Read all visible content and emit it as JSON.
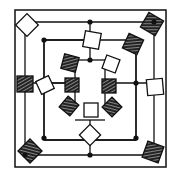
{
  "diagram": {
    "title": "",
    "colors": {
      "ink": "#111111",
      "background": "#ffffff",
      "node_white": "#ffffff"
    },
    "frame": {
      "x": 15,
      "y": 10,
      "w": 151,
      "h": 157
    },
    "rings": [
      {
        "name": "outer-ring",
        "path": "M25,22 L154,22 L154,155 L25,155 Z"
      },
      {
        "name": "middle-ring",
        "path": "M44,40 L136,40 L136,140 L44,140 Z"
      }
    ],
    "connector_lines": [
      "M90,22 L90,60",
      "M44,40 L90,40",
      "M44,40 L44,140",
      "M66,83 L44,83",
      "M66,83 L25,83",
      "M114,83 L154,83",
      "M90,120 L90,140",
      "M90,140 L90,155",
      "M44,140 L90,140",
      "M90,140 L136,140",
      "M136,40 L136,140",
      "M90,60 L75,60",
      "M90,60 L105,60",
      "M90,120 L75,120",
      "M90,120 L105,120",
      "M75,83 L75,105",
      "M105,83 L105,105",
      "M105,60 L105,83",
      "M75,60 L75,83"
    ],
    "dots": [
      {
        "x": 90,
        "y": 22
      },
      {
        "x": 44,
        "y": 40
      },
      {
        "x": 90,
        "y": 60
      },
      {
        "x": 136,
        "y": 83
      },
      {
        "x": 44,
        "y": 138
      },
      {
        "x": 90,
        "y": 155
      },
      {
        "x": 136,
        "y": 138
      },
      {
        "x": 25,
        "y": 155
      },
      {
        "x": 154,
        "y": 22
      }
    ],
    "nodes": [
      {
        "name": "node-top-left-corner",
        "style": "white",
        "cx": 27,
        "cy": 25,
        "size": 16,
        "rot": 45
      },
      {
        "name": "node-top-right-corner",
        "style": "hatch",
        "cx": 152,
        "cy": 24,
        "size": 17,
        "rot": 30
      },
      {
        "name": "node-bottom-left-corner",
        "style": "hatch",
        "cx": 30,
        "cy": 151,
        "size": 17,
        "rot": 45
      },
      {
        "name": "node-bottom-right-corner",
        "style": "hatch",
        "cx": 153,
        "cy": 152,
        "size": 17,
        "rot": 20
      },
      {
        "name": "node-left-mid",
        "style": "hatch",
        "cx": 25,
        "cy": 84,
        "size": 16,
        "rot": 0
      },
      {
        "name": "node-right-mid",
        "style": "white",
        "cx": 155,
        "cy": 87,
        "size": 16,
        "rot": -5
      },
      {
        "name": "node-top-mid",
        "style": "white",
        "cx": 92,
        "cy": 40,
        "size": 16,
        "rot": 10
      },
      {
        "name": "node-bottom-mid",
        "style": "white",
        "cx": 90,
        "cy": 135,
        "size": 15,
        "rot": 45
      },
      {
        "name": "node-ring-top-right-hatch",
        "style": "hatch",
        "cx": 133,
        "cy": 44,
        "size": 16,
        "rot": 25
      },
      {
        "name": "node-ring-left-white",
        "style": "white",
        "cx": 45,
        "cy": 85,
        "size": 14,
        "rot": -25
      },
      {
        "name": "node-inner-top-left",
        "style": "hatch",
        "cx": 70,
        "cy": 63,
        "size": 15,
        "rot": 15
      },
      {
        "name": "node-inner-top-right",
        "style": "white",
        "cx": 111,
        "cy": 64,
        "size": 14,
        "rot": 20
      },
      {
        "name": "node-inner-left",
        "style": "hatch",
        "cx": 72,
        "cy": 85,
        "size": 14,
        "rot": 0
      },
      {
        "name": "node-inner-right",
        "style": "hatch",
        "cx": 109,
        "cy": 86,
        "size": 14,
        "rot": 0
      },
      {
        "name": "node-inner-bottom-left",
        "style": "hatch",
        "cx": 69,
        "cy": 106,
        "size": 14,
        "rot": 40
      },
      {
        "name": "node-inner-bottom-center",
        "style": "white",
        "cx": 91,
        "cy": 110,
        "size": 14,
        "rot": 0
      },
      {
        "name": "node-inner-bottom-right",
        "style": "hatch",
        "cx": 112,
        "cy": 107,
        "size": 14,
        "rot": 45
      }
    ]
  }
}
